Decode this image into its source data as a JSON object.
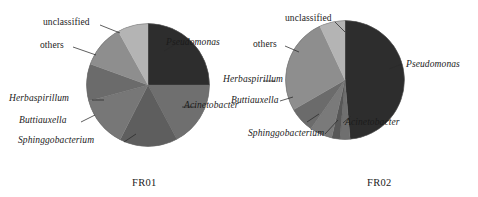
{
  "figure": {
    "background": "#ffffff",
    "label_color": "#1b1b1b"
  },
  "panels": [
    {
      "id": "FR01",
      "caption": "FR01",
      "center": {
        "x": 148,
        "y": 85
      },
      "radius": 62,
      "labels": {
        "unclassified": "unclassified",
        "others": "others",
        "herbaspirillum": "Herbaspirillum",
        "buttiauxella": "Buttiauxella",
        "sphinggobacterium": "Sphinggobacterium",
        "pseudomonas": "Pseudomonas",
        "acinetobacter": "Acinetobacter"
      }
    },
    {
      "id": "FR02",
      "caption": "FR02",
      "center": {
        "x": 345,
        "y": 80
      },
      "radius": 60,
      "labels": {
        "unclassified": "unclassified",
        "others": "others",
        "herbaspirillum": "Herbaspirillum",
        "buttiauxella": "Buttiauxella",
        "sphinggobacterium": "Sphinggobacterium",
        "pseudomonas": "Pseudomonas",
        "acinetobacter": "Acinetobacter"
      }
    }
  ],
  "chart_data": [
    {
      "type": "pie",
      "title": "FR01",
      "xlabel": "",
      "ylabel": "",
      "legend_position": "callout-labels",
      "start_angle_deg": 0,
      "direction": "clockwise",
      "categories": [
        "Pseudomonas",
        "Acinetobacter",
        "Sphinggobacterium",
        "Buttiauxella",
        "Herbaspirillum",
        "others",
        "unclassified"
      ],
      "values": [
        25.0,
        17.2,
        15.3,
        13.3,
        9.7,
        11.4,
        8.1
      ],
      "units": "percent",
      "angles_deg": [
        90,
        62,
        55,
        48,
        35,
        41,
        29
      ],
      "colors": [
        "#2a2a2a",
        "#6f6f6f",
        "#5d5d5d",
        "#777777",
        "#6a6a6a",
        "#8e8e8e",
        "#b6b6b6"
      ]
    },
    {
      "type": "pie",
      "title": "FR02",
      "xlabel": "",
      "ylabel": "",
      "legend_position": "callout-labels",
      "start_angle_deg": 0,
      "direction": "clockwise",
      "categories": [
        "Pseudomonas",
        "Acinetobacter",
        "Sphinggobacterium",
        "Buttiauxella",
        "Herbaspirillum",
        "others",
        "unclassified"
      ],
      "values": [
        48.6,
        2.8,
        2.2,
        6.1,
        6.9,
        26.4,
        7.0
      ],
      "units": "percent",
      "angles_deg": [
        175,
        10,
        8,
        22,
        25,
        95,
        25
      ],
      "colors": [
        "#2a2a2a",
        "#6f6f6f",
        "#565656",
        "#7a7a7a",
        "#6a6a6a",
        "#8e8e8e",
        "#b6b6b6"
      ]
    }
  ]
}
